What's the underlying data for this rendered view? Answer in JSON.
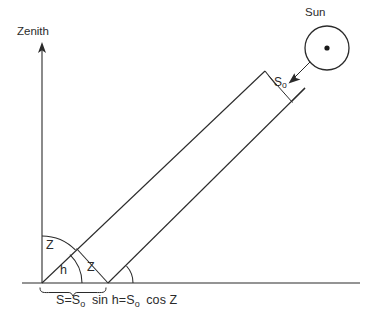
{
  "diagram": {
    "title_semantic": "solar-beam-zenith-angle-diagram",
    "background_color": "#ffffff",
    "line_color": "#2b2b2b",
    "labels": {
      "zenith": "Zenith",
      "sun": "Sun",
      "angle_zenith_top": "Z",
      "angle_elevation": "h",
      "angle_zenith_bottom": "Z",
      "beam_width": "S",
      "beam_width_sub": "o",
      "equation_full": "S=So sin h=So cos Z"
    },
    "equation": {
      "part1_lhs": "S",
      "eq1": "=",
      "part1_sym": "S",
      "part1_sub": "o",
      "part1_fn": "sin",
      "part1_arg": "h",
      "eq2": "=",
      "part2_sym": "S",
      "part2_sub": "o",
      "part2_fn": "cos",
      "part2_arg": "Z"
    },
    "icons": {
      "sun": "sun-icon",
      "zenith_arrow": "up-arrow-icon",
      "beam_arrow": "incoming-ray-arrow-icon"
    },
    "geometry": {
      "ground_line": {
        "x1": 22,
        "y1": 283,
        "x2": 360,
        "y2": 283
      },
      "zenith_axis": {
        "x1": 42,
        "y1": 283,
        "x2": 42,
        "y2": 46
      },
      "beam_lower_edge": {
        "x1": 108,
        "y1": 283,
        "x2": 305,
        "y2": 88
      },
      "beam_upper_edge": {
        "x1": 42,
        "y1": 283,
        "x2": 265,
        "y2": 71
      },
      "beam_end_cap": {
        "x1": 78,
        "y1": 250,
        "x2": 108,
        "y2": 283
      },
      "beam_width_line": {
        "x1": 265,
        "y1": 71,
        "x2": 290,
        "y2": 103
      },
      "sun_circle": {
        "cx": 327,
        "cy": 48,
        "r": 22
      },
      "sun_dot_r": 2.6,
      "brace": {
        "x1": 40,
        "x2": 106,
        "y": 288
      },
      "angles_deg": {
        "zenith_angle_Z": 44,
        "elevation_h": 46
      }
    }
  }
}
